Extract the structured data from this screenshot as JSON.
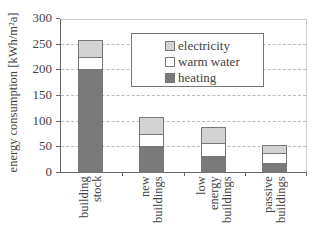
{
  "chart_data": {
    "type": "bar",
    "stacked": true,
    "title": "",
    "xlabel": "",
    "ylabel": "energy consumption [kWh/m²a]",
    "ylim": [
      0,
      300
    ],
    "yticks": [
      "0",
      "50",
      "100",
      "150",
      "200",
      "250",
      "300"
    ],
    "grid": true,
    "legend_position": "upper-center-inside",
    "categories": [
      "building stock",
      "new buildings",
      "low energy buildings",
      "passive buildings"
    ],
    "category_labels": [
      "building\nstock",
      "new\nbuildings",
      "low\nenergy\nbuildings",
      "passive\nbuildings"
    ],
    "series": [
      {
        "name": "heating",
        "values": [
          200,
          50,
          31,
          16
        ],
        "color": "#7a7a7a"
      },
      {
        "name": "warm water",
        "values": [
          26,
          26,
          26,
          23
        ],
        "color": "#ffffff"
      },
      {
        "name": "electricity",
        "values": [
          32,
          31,
          31,
          14
        ],
        "color": "#d3d3d3"
      }
    ],
    "totals": [
      258,
      107,
      88,
      53
    ]
  },
  "legend": {
    "items": [
      {
        "label": "electricity",
        "color": "#d3d3d3"
      },
      {
        "label": "warm water",
        "color": "#ffffff"
      },
      {
        "label": "heating",
        "color": "#7a7a7a"
      }
    ]
  }
}
